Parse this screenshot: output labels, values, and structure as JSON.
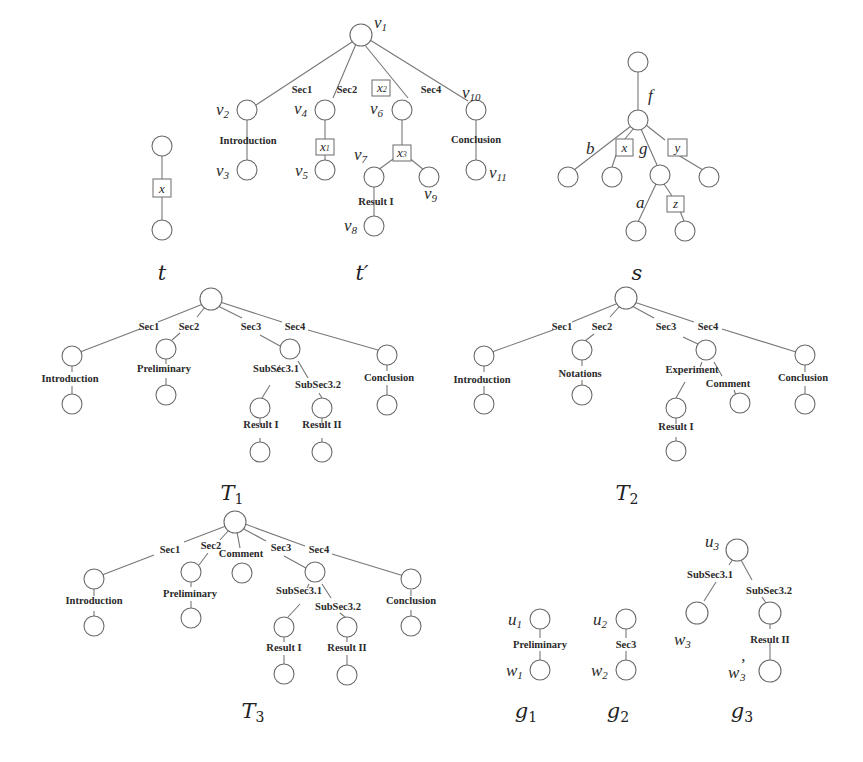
{
  "figure": {
    "trees": {
      "t": {
        "caption": "t",
        "variable_box": "x"
      },
      "t_prime": {
        "caption": "t′",
        "node_names": [
          "v",
          "v",
          "v",
          "v",
          "v",
          "v",
          "v",
          "v",
          "v",
          "v",
          "v"
        ],
        "node_indices": [
          "1",
          "2",
          "3",
          "4",
          "5",
          "6",
          "7",
          "8",
          "9",
          "10",
          "11"
        ],
        "edge_labels": [
          "Sec1",
          "Sec2",
          "Sec4",
          "Introduction",
          "Result I",
          "Conclusion"
        ],
        "variable_boxes": [
          {
            "name": "x",
            "index": "1"
          },
          {
            "name": "x",
            "index": "2"
          },
          {
            "name": "x",
            "index": "3"
          }
        ]
      },
      "s": {
        "caption": "s",
        "edge_labels": [
          "f",
          "b",
          "g",
          "a"
        ],
        "variable_boxes": [
          "x",
          "y",
          "z"
        ]
      },
      "T1": {
        "caption_main": "T",
        "caption_index": "1",
        "edge_labels": [
          "Sec1",
          "Sec2",
          "Sec3",
          "Sec4",
          "Introduction",
          "Preliminary",
          "SubSec3.1",
          "SubSec3.2",
          "Conclusion",
          "Result I",
          "Result II"
        ]
      },
      "T2": {
        "caption_main": "T",
        "caption_index": "2",
        "edge_labels": [
          "Sec1",
          "Sec2",
          "Sec3",
          "Sec4",
          "Introduction",
          "Notations",
          "Experiment",
          "Comment",
          "Conclusion",
          "Result I"
        ]
      },
      "T3": {
        "caption_main": "T",
        "caption_index": "3",
        "edge_labels": [
          "Sec1",
          "Sec2",
          "Comment",
          "Sec3",
          "Sec4",
          "Introduction",
          "Preliminary",
          "SubSec3.1",
          "SubSec3.2",
          "Conclusion",
          "Result I",
          "Result II"
        ]
      },
      "g1": {
        "caption_main": "g",
        "caption_index": "1",
        "root": {
          "name": "u",
          "index": "1"
        },
        "leaf": {
          "name": "w",
          "index": "1"
        },
        "edge_label": "Preliminary"
      },
      "g2": {
        "caption_main": "g",
        "caption_index": "2",
        "root": {
          "name": "u",
          "index": "2"
        },
        "leaf": {
          "name": "w",
          "index": "2"
        },
        "edge_label": "Sec3"
      },
      "g3": {
        "caption_main": "g",
        "caption_index": "3",
        "root": {
          "name": "u",
          "index": "3"
        },
        "leaf_a": {
          "name": "w",
          "index": "3"
        },
        "leaf_b": {
          "name": "w",
          "index": "3",
          "prime": "’"
        },
        "edge_labels": [
          "SubSec3.1",
          "SubSec3.2",
          "Result II"
        ]
      }
    }
  }
}
